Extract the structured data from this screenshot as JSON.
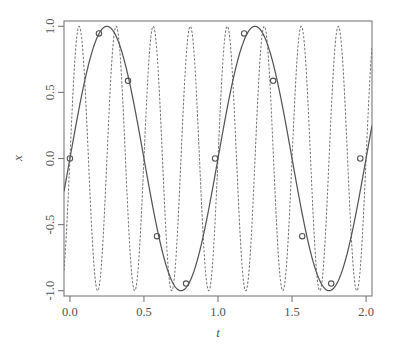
{
  "chart_data": {
    "type": "line",
    "title": "",
    "xlabel": "t",
    "ylabel": "x",
    "xlim": [
      -0.04,
      2.04
    ],
    "ylim": [
      -1.04,
      1.04
    ],
    "xticks": [
      0.0,
      0.5,
      1.0,
      1.5,
      2.0
    ],
    "xtick_labels": [
      "0.0",
      "0.5",
      "1.0",
      "1.5",
      "2.0"
    ],
    "yticks": [
      -1.0,
      -0.5,
      0.0,
      0.5,
      1.0
    ],
    "ytick_labels": [
      "-1.0",
      "-0.5",
      "0.0",
      "0.5",
      "1.0"
    ],
    "grid": false,
    "legend": "none",
    "box": true,
    "series": [
      {
        "name": "solid-curve",
        "style": "solid",
        "color": "#555555",
        "frequency_hz": 1.0,
        "formula": "sin(2*pi*1*t)",
        "description": "Low-frequency continuous sine, one cycle per unit t (2 cycles shown)"
      },
      {
        "name": "dotted-curve",
        "style": "dotted",
        "color": "#777777",
        "frequency_hz": 4.0,
        "formula": "sin(2*pi*4*t)",
        "description": "Aliased high-frequency sine, four cycles per unit t (8 cycles shown)"
      },
      {
        "name": "samples",
        "style": "points",
        "marker": "open-circle",
        "color": "#555555",
        "sample_interval": 0.196078,
        "x": [
          0.0,
          0.1961,
          0.3922,
          0.5882,
          0.7843,
          0.9804,
          1.1765,
          1.3725,
          1.5686,
          1.7647,
          1.9608
        ],
        "y": [
          0.0,
          0.9458,
          0.5878,
          -0.5878,
          -0.9458,
          0.0,
          0.9458,
          0.5878,
          -0.5878,
          -0.9458,
          0.0
        ]
      }
    ]
  },
  "plot": {
    "box_left": 64,
    "box_right": 372,
    "box_top": 21,
    "box_bottom": 296,
    "frame_color": "#7a7a7a"
  }
}
